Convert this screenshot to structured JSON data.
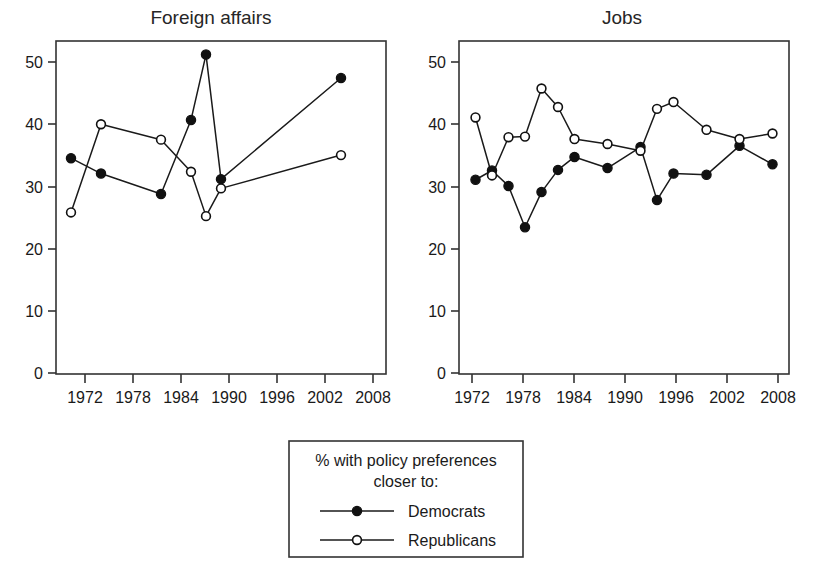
{
  "figure": {
    "width": 813,
    "height": 574,
    "background": "#ffffff",
    "ink_color": "#1a1a1a"
  },
  "legend": {
    "title_line1": "% with policy preferences",
    "title_line2": "closer to:",
    "entries": [
      {
        "label": "Democrats",
        "marker": "filled-circle"
      },
      {
        "label": "Republicans",
        "marker": "open-circle"
      }
    ]
  },
  "chart_data": [
    {
      "type": "line",
      "title": "Foreign affairs",
      "xlabel": "",
      "ylabel": "",
      "xlim": [
        1966,
        2010
      ],
      "ylim": [
        0,
        54
      ],
      "xticks": [
        1972,
        1978,
        1984,
        1990,
        1996,
        2002,
        2008
      ],
      "xtick_labels": [
        "1972",
        "1978",
        "1984",
        "1990",
        "1996",
        "2002",
        "2008"
      ],
      "yticks": [
        0,
        10,
        20,
        30,
        40,
        50
      ],
      "ytick_labels": [
        "0",
        "10",
        "20",
        "30",
        "40",
        "50"
      ],
      "grid": false,
      "legend_position": "below-figure",
      "series": [
        {
          "name": "Democrats",
          "marker": "filled-circle",
          "x": [
            1968,
            1972,
            1980,
            1984,
            1986,
            1988,
            2004
          ],
          "values": [
            35.0,
            32.5,
            29.2,
            41.2,
            51.8,
            31.6,
            48.0
          ]
        },
        {
          "name": "Republicans",
          "marker": "open-circle",
          "x": [
            1968,
            1972,
            1980,
            1984,
            1986,
            1988,
            2004
          ],
          "values": [
            26.2,
            40.5,
            38.0,
            32.8,
            25.6,
            30.1,
            35.5
          ]
        }
      ]
    },
    {
      "type": "line",
      "title": "Jobs",
      "xlabel": "",
      "ylabel": "",
      "xlim": [
        1970,
        2010
      ],
      "ylim": [
        0,
        54
      ],
      "xticks": [
        1972,
        1978,
        1984,
        1990,
        1996,
        2002,
        2008
      ],
      "xtick_labels": [
        "1972",
        "1978",
        "1984",
        "1990",
        "1996",
        "2002",
        "2008"
      ],
      "yticks": [
        0,
        10,
        20,
        30,
        40,
        50
      ],
      "ytick_labels": [
        "0",
        "10",
        "20",
        "30",
        "40",
        "50"
      ],
      "grid": false,
      "legend_position": "below-figure",
      "series": [
        {
          "name": "Democrats",
          "marker": "filled-circle",
          "x": [
            1972,
            1974,
            1976,
            1978,
            1980,
            1982,
            1984,
            1988,
            1992,
            1994,
            1996,
            2000,
            2004,
            2008
          ],
          "values": [
            31.5,
            33.0,
            30.5,
            23.8,
            29.5,
            33.1,
            35.2,
            33.4,
            36.8,
            28.2,
            32.5,
            32.3,
            37.0,
            34.0
          ]
        },
        {
          "name": "Republicans",
          "marker": "open-circle",
          "x": [
            1972,
            1974,
            1976,
            1978,
            1980,
            1982,
            1984,
            1988,
            1992,
            1994,
            1996,
            2000,
            2004,
            2008
          ],
          "values": [
            41.6,
            32.2,
            38.4,
            38.5,
            46.3,
            43.3,
            38.1,
            37.3,
            36.2,
            43.0,
            44.1,
            39.6,
            38.1,
            39.0
          ]
        }
      ]
    }
  ]
}
